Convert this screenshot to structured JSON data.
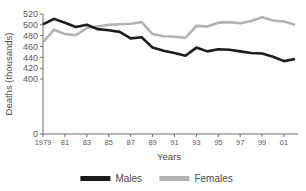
{
  "chart_data": {
    "type": "line",
    "title": "",
    "xlabel": "Years",
    "ylabel": "Deaths (thousands)",
    "x": [
      1979,
      1980,
      1981,
      1982,
      1983,
      1984,
      1985,
      1986,
      1987,
      1988,
      1989,
      1990,
      1991,
      1992,
      1993,
      1994,
      1995,
      1996,
      1997,
      1998,
      1999,
      2000,
      2001,
      2002
    ],
    "x_tick_labels": [
      "1979",
      "81",
      "83",
      "85",
      "87",
      "89",
      "91",
      "93",
      "95",
      "97",
      "99",
      "01"
    ],
    "x_tick_values": [
      1979,
      1981,
      1983,
      1985,
      1987,
      1989,
      1991,
      1993,
      1995,
      1997,
      1999,
      2001
    ],
    "y_tick_labels": [
      "0",
      "400",
      "420",
      "440",
      "460",
      "480",
      "500",
      "520"
    ],
    "y_tick_values": [
      0,
      400,
      420,
      440,
      460,
      480,
      500,
      520
    ],
    "ylim": [
      400,
      520
    ],
    "y_axis_broken": true,
    "grid": false,
    "legend_position": "bottom",
    "series": [
      {
        "name": "Males",
        "color": "#1c1c1c",
        "values": [
          501,
          511,
          504,
          496,
          500,
          492,
          490,
          487,
          475,
          477,
          458,
          452,
          448,
          443,
          458,
          451,
          455,
          454,
          451,
          448,
          447,
          441,
          433,
          437
        ]
      },
      {
        "name": "Females",
        "color": "#b3b3b3",
        "values": [
          468,
          491,
          483,
          481,
          494,
          497,
          500,
          501,
          502,
          505,
          483,
          479,
          478,
          476,
          498,
          497,
          504,
          505,
          503,
          507,
          514,
          508,
          506,
          500
        ]
      }
    ]
  },
  "legend": {
    "items": [
      {
        "label": "Males",
        "color": "#1c1c1c"
      },
      {
        "label": "Females",
        "color": "#b3b3b3"
      }
    ]
  },
  "axes": {
    "y_title": "Deaths (thousands)",
    "x_title": "Years"
  }
}
